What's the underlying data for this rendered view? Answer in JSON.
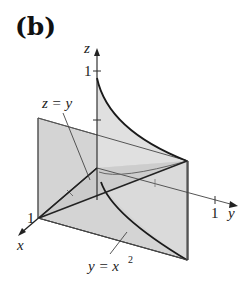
{
  "panel": {
    "label": "(b)"
  },
  "axes": {
    "z_label": "z",
    "x_label": "x",
    "y_label": "y",
    "z_tick": "1",
    "x_tick": "1",
    "y_tick": "1"
  },
  "annotations": {
    "plane_eq_left": "z = y",
    "cylinder_eq_left": "y = x",
    "cylinder_eq_exp": "2"
  },
  "colors": {
    "plane_fill": "#d3d3d3",
    "surface_fill": "#dcdcdc",
    "edge": "#333333",
    "dark_edge": "#1a1a1a"
  }
}
